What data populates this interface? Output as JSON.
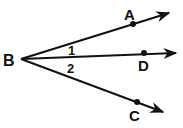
{
  "diagram": {
    "type": "angle-rays",
    "vertex": {
      "label": "B",
      "x": 21,
      "y": 59
    },
    "rays": [
      {
        "name": "BA",
        "point_label": "A",
        "point": {
          "x": 133,
          "y": 24
        },
        "end": {
          "x": 169,
          "y": 13
        }
      },
      {
        "name": "BD",
        "point_label": "D",
        "point": {
          "x": 144,
          "y": 53
        },
        "end": {
          "x": 176,
          "y": 53
        }
      },
      {
        "name": "BC",
        "point_label": "C",
        "point": {
          "x": 137,
          "y": 102
        },
        "end": {
          "x": 163,
          "y": 112
        }
      }
    ],
    "angles": [
      {
        "label": "1",
        "between": [
          "BA",
          "BD"
        ]
      },
      {
        "label": "2",
        "between": [
          "BD",
          "BC"
        ]
      }
    ],
    "colors": {
      "stroke": "#111111",
      "background": "#ffffff"
    }
  }
}
